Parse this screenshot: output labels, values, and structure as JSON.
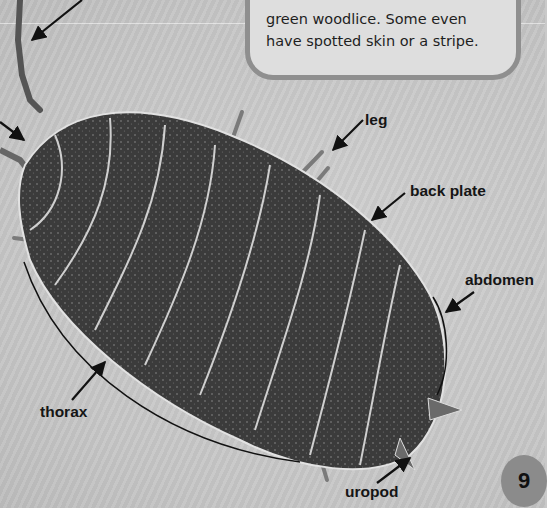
{
  "page": {
    "background_color": "#c9c9c9",
    "page_number": "9"
  },
  "info_box": {
    "lines": [
      "green woodlice. Some even",
      "have spotted skin or a stripe."
    ]
  },
  "illustration": {
    "subject": "woodlouse (top view)",
    "icon": "woodlouse-photo"
  },
  "labels": {
    "leg": "leg",
    "back_plate": "back plate",
    "abdomen": "abdomen",
    "thorax": "thorax",
    "uropod": "uropod"
  },
  "colors": {
    "text": "#151515",
    "box_fill": "#dedede",
    "box_border": "#8f8f8f",
    "page_number_circle": "#8b8b8b",
    "body": "#3a3a3a"
  }
}
